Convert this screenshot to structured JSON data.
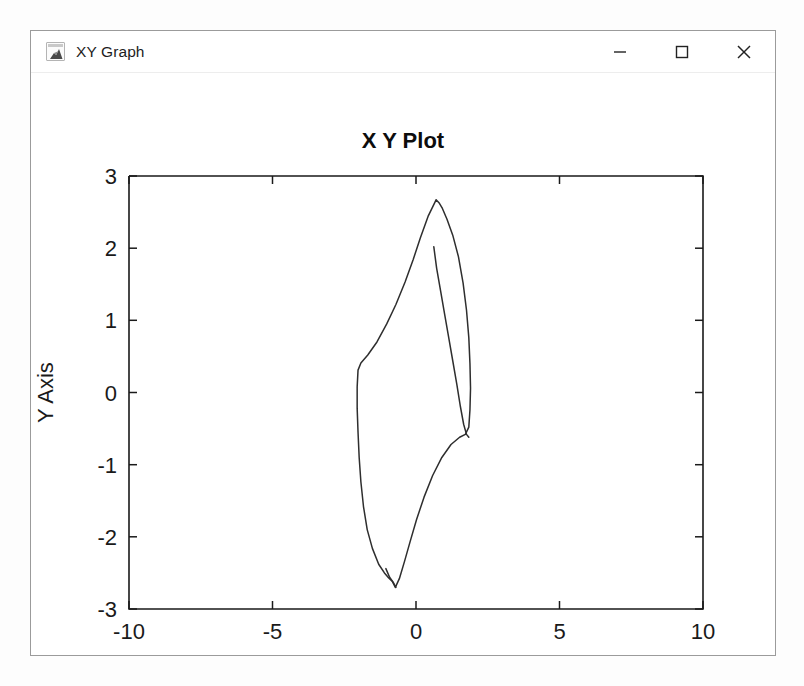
{
  "window": {
    "title": "XY Graph",
    "icon": "matlab-scope-icon",
    "controls": [
      {
        "name": "minimize-button",
        "glyph": "minimize"
      },
      {
        "name": "maximize-button",
        "glyph": "maximize"
      },
      {
        "name": "close-button",
        "glyph": "close"
      }
    ]
  },
  "colors": {
    "trace": "#2e2e2e",
    "axis": "#1a1a1a",
    "window_border": "#9b9b9b",
    "background": "#ffffff"
  },
  "chart_data": {
    "type": "line",
    "title": "X Y Plot",
    "xlabel": "X Axis",
    "ylabel": "Y Axis",
    "xlim": [
      -10,
      10
    ],
    "ylim": [
      -3,
      3
    ],
    "xticks": [
      -10,
      -5,
      0,
      5,
      10
    ],
    "yticks": [
      -3,
      -2,
      -1,
      0,
      1,
      2,
      3
    ],
    "xticklabels": [
      "-10",
      "-5",
      "0",
      "5",
      "10"
    ],
    "yticklabels": [
      "3",
      "2",
      "1",
      "0",
      "-1",
      "-2",
      "-3"
    ],
    "grid": false,
    "legend": null,
    "series": [
      {
        "name": "limit-cycle-outer",
        "comment": "Closed phase-plane trajectory (outer loop)",
        "points": [
          [
            0.7,
            2.67
          ],
          [
            0.42,
            2.44
          ],
          [
            0.15,
            2.14
          ],
          [
            -0.1,
            1.84
          ],
          [
            -0.38,
            1.53
          ],
          [
            -0.7,
            1.22
          ],
          [
            -1.02,
            0.95
          ],
          [
            -1.36,
            0.7
          ],
          [
            -1.68,
            0.52
          ],
          [
            -1.92,
            0.41
          ],
          [
            -2.02,
            0.31
          ],
          [
            -2.05,
            0.08
          ],
          [
            -2.05,
            -0.22
          ],
          [
            -2.02,
            -0.55
          ],
          [
            -1.98,
            -0.9
          ],
          [
            -1.92,
            -1.24
          ],
          [
            -1.83,
            -1.58
          ],
          [
            -1.7,
            -1.9
          ],
          [
            -1.52,
            -2.16
          ],
          [
            -1.3,
            -2.38
          ],
          [
            -1.1,
            -2.5
          ],
          [
            -0.95,
            -2.57
          ],
          [
            -0.82,
            -2.62
          ],
          [
            -0.72,
            -2.7
          ],
          [
            -0.58,
            -2.58
          ],
          [
            -0.4,
            -2.34
          ],
          [
            -0.2,
            -2.06
          ],
          [
            0.02,
            -1.76
          ],
          [
            0.28,
            -1.45
          ],
          [
            0.58,
            -1.15
          ],
          [
            0.9,
            -0.9
          ],
          [
            1.22,
            -0.72
          ],
          [
            1.52,
            -0.62
          ],
          [
            1.72,
            -0.58
          ],
          [
            1.84,
            -0.48
          ],
          [
            1.88,
            -0.24
          ],
          [
            1.9,
            0.06
          ],
          [
            1.88,
            0.4
          ],
          [
            1.84,
            0.76
          ],
          [
            1.76,
            1.14
          ],
          [
            1.64,
            1.52
          ],
          [
            1.48,
            1.88
          ],
          [
            1.28,
            2.18
          ],
          [
            1.08,
            2.4
          ],
          [
            0.92,
            2.55
          ],
          [
            0.8,
            2.63
          ],
          [
            0.7,
            2.67
          ]
        ]
      },
      {
        "name": "limit-cycle-inner-start",
        "comment": "Inner partial arc — trajectory start segment spiralling onto the cycle",
        "points": [
          [
            0.62,
            2.02
          ],
          [
            0.72,
            1.72
          ],
          [
            0.86,
            1.4
          ],
          [
            1.0,
            1.08
          ],
          [
            1.14,
            0.76
          ],
          [
            1.28,
            0.44
          ],
          [
            1.42,
            0.12
          ],
          [
            1.54,
            -0.18
          ],
          [
            1.66,
            -0.44
          ],
          [
            1.76,
            -0.58
          ],
          [
            1.84,
            -0.62
          ]
        ]
      },
      {
        "name": "bottom-crossing-loop",
        "comment": "Small self-intersection near the minimum",
        "points": [
          [
            -1.05,
            -2.44
          ],
          [
            -0.92,
            -2.56
          ],
          [
            -0.78,
            -2.64
          ],
          [
            -0.7,
            -2.7
          ]
        ]
      }
    ],
    "annotations": {
      "peak": {
        "x": 0.7,
        "y": 2.67
      },
      "trough": {
        "x": -0.72,
        "y": -2.7
      },
      "leftmost": {
        "x": -2.05,
        "y": -0.1
      },
      "rightmost": {
        "x": 1.9,
        "y": 0.06
      }
    }
  }
}
